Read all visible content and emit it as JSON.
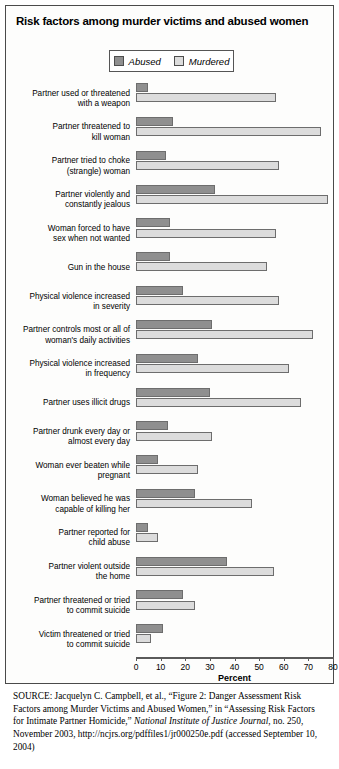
{
  "figure": {
    "title": "Risk factors among murder victims and abused women",
    "axis_title": "Percent",
    "legend": [
      {
        "label": "Abused",
        "color": "#8f8f8f",
        "icon": "legend-swatch-abused"
      },
      {
        "label": "Murdered",
        "color": "#dcdcdc",
        "icon": "legend-swatch-murdered"
      }
    ]
  },
  "source": {
    "prefix": "SOURCE:",
    "line1": " Jacquelyn C. Campbell, et al., “Figure 2: Danger Assessment Risk Factors among Murder Victims and Abused Women,” in “Assessing Risk Factors for Intimate Partner Homicide,” ",
    "italic1": "National Institute of Justice Journal",
    "line2": ", no. 250, November 2003, http://ncjrs.org/pdffiles1/jr000250e.pdf (accessed September 10, 2004)"
  },
  "chart_data": {
    "type": "bar",
    "orientation": "horizontal",
    "title": "Risk factors among murder victims and abused women",
    "xlabel": "Percent",
    "ylabel": "",
    "xlim": [
      0,
      80
    ],
    "xticks": [
      0,
      10,
      20,
      30,
      40,
      50,
      60,
      70,
      80
    ],
    "grid": false,
    "legend_position": "top-center",
    "categories": [
      "Partner used or threatened with a weapon",
      "Partner threatened to kill woman",
      "Partner tried to choke (strangle) woman",
      "Partner violently and constantly jealous",
      "Woman forced to have sex when not wanted",
      "Gun in the house",
      "Physical violence increased in severity",
      "Partner controls most or all of woman's daily activities",
      "Physical violence increased in frequency",
      "Partner uses illicit drugs",
      "Partner drunk every day or almost every day",
      "Woman ever beaten while pregnant",
      "Woman believed he was capable of killing her",
      "Partner reported for child abuse",
      "Partner violent outside the home",
      "Partner threatened or tried to commit suicide",
      "Victim threatened or tried to commit suicide"
    ],
    "category_lines": [
      [
        "Partner used or threatened",
        "with a weapon"
      ],
      [
        "Partner threatened to",
        "kill woman"
      ],
      [
        "Partner tried to choke",
        "(strangle) woman"
      ],
      [
        "Partner violently and",
        "constantly jealous"
      ],
      [
        "Woman forced to have",
        "sex when not wanted"
      ],
      [
        "Gun in the house"
      ],
      [
        "Physical violence increased",
        "in severity"
      ],
      [
        "Partner controls most or all of",
        "woman's daily activities"
      ],
      [
        "Physical violence increased",
        "in frequency"
      ],
      [
        "Partner uses illicit drugs"
      ],
      [
        "Partner drunk every day or",
        "almost every day"
      ],
      [
        "Woman ever beaten while",
        "pregnant"
      ],
      [
        "Woman believed he was",
        "capable of killing her"
      ],
      [
        "Partner reported for",
        "child abuse"
      ],
      [
        "Partner violent outside",
        "the home"
      ],
      [
        "Partner threatened or tried",
        "to commit suicide"
      ],
      [
        "Victim threatened or tried",
        "to commit suicide"
      ]
    ],
    "series": [
      {
        "name": "Abused",
        "color": "#8f8f8f",
        "values": [
          5,
          15,
          12,
          32,
          14,
          14,
          19,
          31,
          25,
          30,
          13,
          9,
          24,
          5,
          37,
          19,
          11
        ]
      },
      {
        "name": "Murdered",
        "color": "#dcdcdc",
        "values": [
          57,
          75,
          58,
          78,
          57,
          53,
          58,
          72,
          62,
          67,
          31,
          25,
          47,
          9,
          56,
          24,
          6
        ]
      }
    ]
  }
}
